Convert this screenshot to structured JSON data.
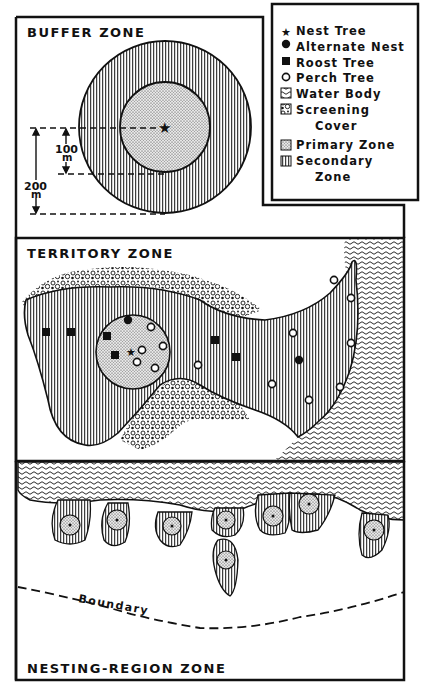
{
  "buffer_zone": {
    "title": "BUFFER ZONE",
    "inner_radius_label": "100",
    "inner_radius_unit": "m",
    "outer_radius_label": "200",
    "outer_radius_unit": "m"
  },
  "legend": {
    "items": [
      {
        "symbol": "star-icon",
        "label": "Nest Tree"
      },
      {
        "symbol": "filled-circle-icon",
        "label": "Alternate Nest"
      },
      {
        "symbol": "filled-square-icon",
        "label": "Roost Tree"
      },
      {
        "symbol": "open-circle-icon",
        "label": "Perch Tree"
      },
      {
        "symbol": "wave-pattern-icon",
        "label": "Water Body"
      },
      {
        "symbol": "shrub-pattern-icon",
        "label": "Screening",
        "label2": "Cover"
      },
      {
        "symbol": "stipple-pattern-icon",
        "label": "Primary Zone"
      },
      {
        "symbol": "vertical-hatch-icon",
        "label": "Secondary",
        "label2": "Zone"
      }
    ]
  },
  "territory_zone": {
    "title": "TERRITORY ZONE"
  },
  "nesting_region_zone": {
    "title": "NESTING-REGION ZONE",
    "boundary_label": "Boundary"
  },
  "colors": {
    "ink": "#111111",
    "paper": "#ffffff",
    "stipple": "#cfcfcf"
  }
}
